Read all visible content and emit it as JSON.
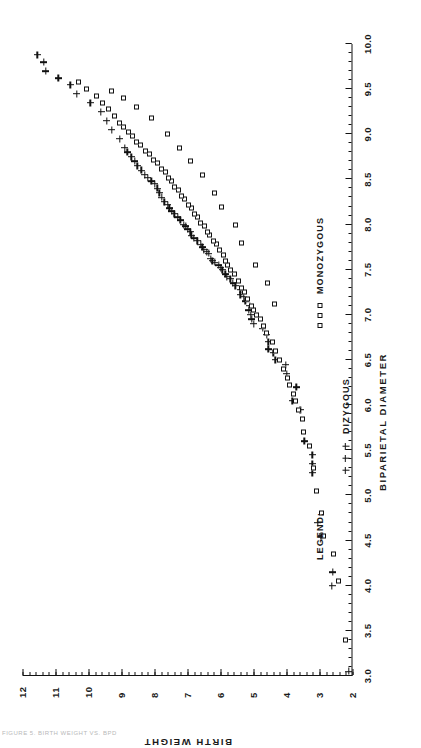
{
  "figure": {
    "caption": "FIGURE 5.  BIRTH WEIGHT VS. BPD",
    "orientation": "landscape-rotated-90-ccw"
  },
  "legend": {
    "title": "LEGEND:",
    "entries": [
      {
        "label": "DIZYGOUS",
        "marker": "plus-marker",
        "marker_glyph": "+"
      },
      {
        "label": "MONOZYGOUS",
        "marker": "square-marker",
        "marker_glyph": "□"
      }
    ]
  },
  "chart_data": {
    "type": "scatter",
    "title": "",
    "xlabel": "BIPARIETAL DIAMETER",
    "ylabel": "BIRTH WEIGHT",
    "xlim": [
      3.0,
      10.0
    ],
    "ylim": [
      2,
      12
    ],
    "xticks": [
      3.0,
      3.5,
      4.0,
      4.5,
      5.0,
      5.5,
      6.0,
      6.5,
      7.0,
      7.5,
      8.0,
      8.5,
      9.0,
      9.5,
      10.0
    ],
    "xticklabels": [
      "3.0",
      "3.5",
      "4.0",
      "4.5",
      "5.0",
      "5.5",
      "6.0",
      "6.5",
      "7.0",
      "7.5",
      "8.0",
      "8.5",
      "9.0",
      "9.5",
      "10.0"
    ],
    "x_minor_tick_step": 0.1,
    "yticks": [
      2,
      3,
      4,
      5,
      6,
      7,
      8,
      9,
      10,
      11,
      12
    ],
    "yticklabels": [
      "2",
      "3",
      "4",
      "5",
      "6",
      "7",
      "8",
      "9",
      "10",
      "11",
      "12"
    ],
    "y_minor_tick_step": 0.2,
    "grid": false,
    "legend_position": "below-axis-right",
    "marker_color": "#111111",
    "series": [
      {
        "name": "DIZYGOUS",
        "marker": "plus-marker",
        "points": [
          [
            3.05,
            2.12
          ],
          [
            4.0,
            2.62
          ],
          [
            4.15,
            2.6
          ],
          [
            4.55,
            2.95
          ],
          [
            4.7,
            3.05
          ],
          [
            5.25,
            3.22
          ],
          [
            5.35,
            3.22
          ],
          [
            5.45,
            3.22
          ],
          [
            5.6,
            3.46
          ],
          [
            5.95,
            3.58
          ],
          [
            6.05,
            3.82
          ],
          [
            6.2,
            3.7
          ],
          [
            6.35,
            4.0
          ],
          [
            6.45,
            4.02
          ],
          [
            6.5,
            4.34
          ],
          [
            6.58,
            4.4
          ],
          [
            6.62,
            4.55
          ],
          [
            6.7,
            4.55
          ],
          [
            6.78,
            4.6
          ],
          [
            6.85,
            4.72
          ],
          [
            6.9,
            5.0
          ],
          [
            6.95,
            5.05
          ],
          [
            7.0,
            5.08
          ],
          [
            7.05,
            5.15
          ],
          [
            7.1,
            5.12
          ],
          [
            7.15,
            5.25
          ],
          [
            7.2,
            5.3
          ],
          [
            7.22,
            5.4
          ],
          [
            7.28,
            5.4
          ],
          [
            7.32,
            5.55
          ],
          [
            7.35,
            5.62
          ],
          [
            7.4,
            5.7
          ],
          [
            7.42,
            5.8
          ],
          [
            7.45,
            5.86
          ],
          [
            7.5,
            5.95
          ],
          [
            7.52,
            6.0
          ],
          [
            7.55,
            6.05
          ],
          [
            7.58,
            6.18
          ],
          [
            7.6,
            6.25
          ],
          [
            7.62,
            6.3
          ],
          [
            7.68,
            6.35
          ],
          [
            7.7,
            6.42
          ],
          [
            7.72,
            6.5
          ],
          [
            7.75,
            6.55
          ],
          [
            7.78,
            6.6
          ],
          [
            7.82,
            6.7
          ],
          [
            7.85,
            6.8
          ],
          [
            7.88,
            6.88
          ],
          [
            7.92,
            6.92
          ],
          [
            7.95,
            7.0
          ],
          [
            7.98,
            7.05
          ],
          [
            8.0,
            7.12
          ],
          [
            8.05,
            7.22
          ],
          [
            8.08,
            7.3
          ],
          [
            8.12,
            7.4
          ],
          [
            8.15,
            7.48
          ],
          [
            8.18,
            7.55
          ],
          [
            8.22,
            7.6
          ],
          [
            8.25,
            7.7
          ],
          [
            8.3,
            7.78
          ],
          [
            8.35,
            7.85
          ],
          [
            8.4,
            7.92
          ],
          [
            8.45,
            8.0
          ],
          [
            8.48,
            8.1
          ],
          [
            8.52,
            8.2
          ],
          [
            8.55,
            8.3
          ],
          [
            8.6,
            8.4
          ],
          [
            8.65,
            8.52
          ],
          [
            8.7,
            8.6
          ],
          [
            8.75,
            8.7
          ],
          [
            8.8,
            8.82
          ],
          [
            8.85,
            8.9
          ],
          [
            8.95,
            9.05
          ],
          [
            9.05,
            9.3
          ],
          [
            9.15,
            9.45
          ],
          [
            9.25,
            9.62
          ],
          [
            9.35,
            9.95
          ],
          [
            9.45,
            10.35
          ],
          [
            9.55,
            10.55
          ],
          [
            9.62,
            10.92
          ],
          [
            9.7,
            11.3
          ],
          [
            9.8,
            11.35
          ],
          [
            9.88,
            11.55
          ]
        ]
      },
      {
        "name": "MONOZYGOUS",
        "marker": "square-marker",
        "points": [
          [
            3.4,
            2.2
          ],
          [
            4.05,
            2.42
          ],
          [
            4.35,
            2.58
          ],
          [
            4.55,
            2.88
          ],
          [
            4.8,
            2.95
          ],
          [
            5.05,
            3.08
          ],
          [
            5.3,
            3.18
          ],
          [
            5.55,
            3.3
          ],
          [
            5.7,
            3.48
          ],
          [
            5.85,
            3.52
          ],
          [
            5.95,
            3.64
          ],
          [
            6.05,
            3.72
          ],
          [
            6.12,
            3.8
          ],
          [
            6.22,
            3.9
          ],
          [
            6.3,
            3.98
          ],
          [
            6.4,
            4.1
          ],
          [
            6.5,
            4.2
          ],
          [
            6.6,
            4.32
          ],
          [
            6.7,
            4.42
          ],
          [
            6.8,
            4.62
          ],
          [
            6.88,
            4.7
          ],
          [
            6.95,
            4.8
          ],
          [
            7.0,
            4.9
          ],
          [
            7.05,
            5.0
          ],
          [
            7.1,
            5.05
          ],
          [
            7.18,
            5.18
          ],
          [
            7.25,
            5.28
          ],
          [
            7.3,
            5.35
          ],
          [
            7.38,
            5.45
          ],
          [
            7.45,
            5.58
          ],
          [
            7.5,
            5.7
          ],
          [
            7.55,
            5.78
          ],
          [
            7.6,
            5.85
          ],
          [
            7.66,
            5.92
          ],
          [
            7.72,
            6.02
          ],
          [
            7.78,
            6.12
          ],
          [
            7.82,
            6.22
          ],
          [
            7.88,
            6.32
          ],
          [
            7.92,
            6.4
          ],
          [
            7.98,
            6.5
          ],
          [
            8.02,
            6.6
          ],
          [
            8.08,
            6.7
          ],
          [
            8.12,
            6.78
          ],
          [
            8.18,
            6.88
          ],
          [
            8.22,
            6.98
          ],
          [
            8.28,
            7.08
          ],
          [
            8.32,
            7.18
          ],
          [
            8.38,
            7.28
          ],
          [
            8.42,
            7.38
          ],
          [
            8.48,
            7.48
          ],
          [
            8.52,
            7.58
          ],
          [
            8.58,
            7.68
          ],
          [
            8.62,
            7.8
          ],
          [
            8.68,
            7.9
          ],
          [
            8.72,
            8.02
          ],
          [
            8.78,
            8.15
          ],
          [
            8.82,
            8.28
          ],
          [
            8.88,
            8.42
          ],
          [
            8.92,
            8.55
          ],
          [
            8.98,
            8.68
          ],
          [
            9.02,
            8.8
          ],
          [
            9.08,
            8.95
          ],
          [
            9.12,
            9.05
          ],
          [
            9.2,
            9.22
          ],
          [
            9.28,
            9.4
          ],
          [
            9.35,
            9.58
          ],
          [
            9.42,
            9.75
          ],
          [
            9.5,
            10.05
          ],
          [
            9.58,
            10.3
          ],
          [
            7.12,
            4.35
          ],
          [
            7.35,
            4.58
          ],
          [
            7.55,
            4.95
          ],
          [
            7.8,
            5.35
          ],
          [
            8.0,
            5.55
          ],
          [
            8.2,
            5.98
          ],
          [
            8.35,
            6.18
          ],
          [
            8.55,
            6.55
          ],
          [
            8.7,
            6.9
          ],
          [
            8.85,
            7.25
          ],
          [
            9.0,
            7.62
          ],
          [
            9.18,
            8.1
          ],
          [
            9.3,
            8.55
          ],
          [
            9.4,
            8.95
          ],
          [
            9.48,
            9.3
          ]
        ]
      }
    ]
  }
}
